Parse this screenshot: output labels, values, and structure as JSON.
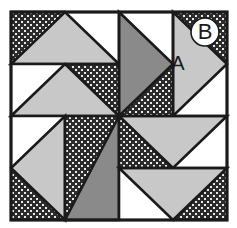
{
  "figure": {
    "kind": "quilt-block-diagram",
    "width": 237,
    "height": 228,
    "background": "#ffffff"
  },
  "colors": {
    "background": "#ffffff",
    "outline": "#1a1a1a",
    "light_gray": "#c8c8c8",
    "medium_gray": "#8a8a8a",
    "white_patch": "#ffffff",
    "dark_texture_base": "#2b2b2b",
    "dark_texture_dot": "#e8e8e8",
    "label_text": "#1a1a1a",
    "badge_fill": "#ffffff",
    "badge_stroke": "#1a1a1a"
  },
  "block": {
    "x": 11,
    "y": 12,
    "width": 216,
    "height": 208,
    "border_width": 3,
    "grid": {
      "columns": 4,
      "rows": 4,
      "cell_width": 54,
      "cell_height": 52,
      "x_lines": [
        11,
        65,
        119,
        173,
        227
      ],
      "y_lines": [
        12,
        64,
        116,
        168,
        220
      ]
    }
  },
  "fills": {
    "light": "light_gray",
    "medium": "medium_gray",
    "white": "white_patch",
    "dark": "dark_texture"
  },
  "units": [
    {
      "id": "u-r0c0",
      "row": 0,
      "col": 0,
      "span_cols": 2,
      "span_rows": 1,
      "shape": "half-square-triangle",
      "diagonal": "major",
      "upper_fill": "dark",
      "lower_fill": "light",
      "note": "top-left wide unit: dark upper-left wedge, light triangle pointing up"
    },
    {
      "id": "u-r0c2",
      "row": 0,
      "col": 2,
      "span_cols": 1,
      "span_rows": 2,
      "shape": "half-square-triangle",
      "diagonal": "minor",
      "upper_fill": "white",
      "lower_fill": "medium",
      "note": "top-center tall unit: medium gray triangle pointing right, white above"
    },
    {
      "id": "u-r0c3",
      "row": 0,
      "col": 3,
      "span_cols": 1,
      "span_rows": 2,
      "shape": "half-square-triangle",
      "diagonal": "major",
      "upper_fill": "dark",
      "lower_fill": "light",
      "note": "top-right tall unit labeled A, dark texture behind, B badge at corner"
    },
    {
      "id": "u-r1c0",
      "row": 1,
      "col": 0,
      "span_cols": 2,
      "span_rows": 1,
      "shape": "half-square-triangle",
      "diagonal": "minor",
      "upper_fill": "white",
      "lower_fill": "light",
      "note": "second row left wide unit: light triangle, white upper-left"
    },
    {
      "id": "u-r1c2",
      "row": 1,
      "col": 2,
      "span_cols": 1,
      "span_rows": 1,
      "shape": "solid",
      "fill": "dark",
      "note": "dark textured square left of center, upper half"
    },
    {
      "id": "u-r2c1",
      "row": 2,
      "col": 1,
      "span_cols": 1,
      "span_rows": 2,
      "shape": "half-square-triangle",
      "diagonal": "minor",
      "upper_fill": "dark",
      "lower_fill": "medium",
      "note": "bottom-center tall unit: medium gray triangle pointing down-left"
    },
    {
      "id": "u-r2c0",
      "row": 2,
      "col": 0,
      "span_cols": 1,
      "span_rows": 2,
      "shape": "half-square-triangle",
      "diagonal": "major",
      "upper_fill": "white",
      "lower_fill": "light",
      "note": "bottom-left tall unit: light triangle pointing down-left, dark corner"
    },
    {
      "id": "u-r2c2",
      "row": 2,
      "col": 2,
      "span_cols": 2,
      "span_rows": 1,
      "shape": "half-square-triangle",
      "diagonal": "minor",
      "upper_fill": "light",
      "lower_fill": "dark",
      "note": "right-of-center wide unit: light triangle pointing down, dark below-left"
    },
    {
      "id": "u-r3c2",
      "row": 3,
      "col": 2,
      "span_cols": 2,
      "span_rows": 1,
      "shape": "half-square-triangle",
      "diagonal": "major",
      "upper_fill": "light",
      "lower_fill": "dark",
      "note": "bottom-right wide unit: light triangle pointing down, dark lower-right corner"
    }
  ],
  "labels": {
    "patch_a": {
      "text": "A",
      "x": 178,
      "y": 65,
      "font_size": 20,
      "description": "label on light gray triangle in top-right unit"
    },
    "patch_b": {
      "text": "B",
      "cx": 205,
      "cy": 32,
      "radius": 14,
      "font_size": 22,
      "description": "label in white circle badge over dark textured corner"
    }
  }
}
